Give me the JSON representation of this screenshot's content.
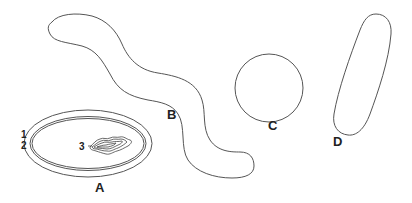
{
  "figure": {
    "colors": {
      "stroke": "#555555",
      "text": "#222222",
      "background": "#ffffff"
    },
    "cells": [
      {
        "id": "A",
        "label": "A",
        "shape": "coccobacillus-with-envelope"
      },
      {
        "id": "B",
        "label": "B",
        "shape": "spirillum"
      },
      {
        "id": "C",
        "label": "C",
        "shape": "coccus"
      },
      {
        "id": "D",
        "label": "D",
        "shape": "bacillus"
      }
    ],
    "parts": [
      {
        "number": "1",
        "target": "outer-layer"
      },
      {
        "number": "2",
        "target": "inner-membrane"
      },
      {
        "number": "3",
        "target": "nucleoid"
      }
    ]
  }
}
